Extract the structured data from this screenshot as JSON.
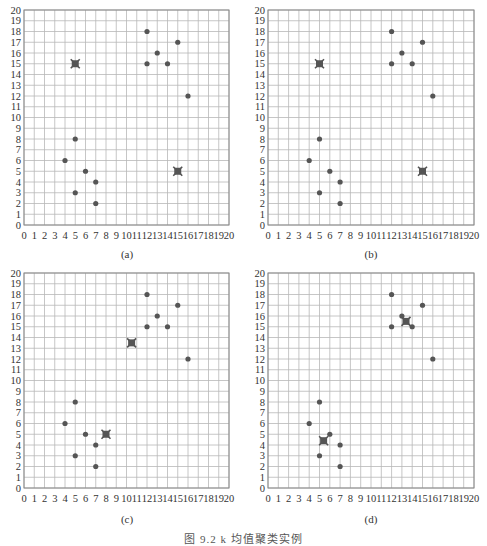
{
  "figure": {
    "caption": "图 9.2  k 均值聚类实例",
    "colors": {
      "grid": "#b8b8b8",
      "frame": "#888888",
      "point": "#555555",
      "centroid": "#555555",
      "text": "#333333"
    }
  },
  "chart_data": [
    {
      "type": "scatter",
      "panel_label": "(a)",
      "title": "",
      "xlabel": "",
      "ylabel": "",
      "xlim": [
        0,
        20
      ],
      "ylim": [
        0,
        20
      ],
      "x_ticks": [
        "0",
        "1",
        "2",
        "3",
        "4",
        "5",
        "6",
        "7",
        "8",
        "9",
        "10",
        "11",
        "12",
        "13",
        "14",
        "15",
        "16",
        "17",
        "18",
        "19",
        "20"
      ],
      "y_ticks": [
        "0",
        "1",
        "2",
        "3",
        "4",
        "5",
        "6",
        "7",
        "8",
        "9",
        "10",
        "11",
        "12",
        "13",
        "14",
        "15",
        "16",
        "17",
        "18",
        "19",
        "20"
      ],
      "grid": true,
      "series": [
        {
          "name": "points",
          "marker": "circle",
          "x": [
            4,
            5,
            5,
            6,
            7,
            7,
            12,
            12,
            13,
            14,
            15,
            16
          ],
          "y": [
            6,
            8,
            3,
            5,
            4,
            2,
            18,
            15,
            16,
            15,
            17,
            12
          ]
        },
        {
          "name": "centroids",
          "marker": "x-square",
          "x": [
            5,
            15
          ],
          "y": [
            15,
            5
          ]
        }
      ]
    },
    {
      "type": "scatter",
      "panel_label": "(b)",
      "title": "",
      "xlabel": "",
      "ylabel": "",
      "xlim": [
        0,
        20
      ],
      "ylim": [
        0,
        20
      ],
      "x_ticks": [
        "0",
        "1",
        "2",
        "3",
        "4",
        "5",
        "6",
        "7",
        "8",
        "9",
        "10",
        "11",
        "12",
        "13",
        "14",
        "15",
        "16",
        "17",
        "18",
        "19",
        "20"
      ],
      "y_ticks": [
        "0",
        "1",
        "2",
        "3",
        "4",
        "5",
        "6",
        "7",
        "8",
        "9",
        "10",
        "11",
        "12",
        "13",
        "14",
        "15",
        "16",
        "17",
        "18",
        "19",
        "20"
      ],
      "grid": true,
      "series": [
        {
          "name": "cluster-1 points",
          "marker": "circle",
          "x": [
            12,
            12,
            13,
            14,
            15,
            16
          ],
          "y": [
            18,
            15,
            16,
            15,
            17,
            12
          ]
        },
        {
          "name": "cluster-2 points",
          "marker": "circle",
          "x": [
            4,
            5,
            5,
            6,
            7,
            7
          ],
          "y": [
            6,
            8,
            3,
            5,
            4,
            2
          ]
        },
        {
          "name": "centroids",
          "marker": "x-square",
          "x": [
            5,
            15
          ],
          "y": [
            15,
            5
          ]
        }
      ]
    },
    {
      "type": "scatter",
      "panel_label": "(c)",
      "title": "",
      "xlabel": "",
      "ylabel": "",
      "xlim": [
        0,
        20
      ],
      "ylim": [
        0,
        20
      ],
      "x_ticks": [
        "0",
        "1",
        "2",
        "3",
        "4",
        "5",
        "6",
        "7",
        "8",
        "9",
        "10",
        "11",
        "12",
        "13",
        "14",
        "15",
        "16",
        "17",
        "18",
        "19",
        "20"
      ],
      "y_ticks": [
        "0",
        "1",
        "2",
        "3",
        "4",
        "5",
        "6",
        "7",
        "8",
        "9",
        "10",
        "11",
        "12",
        "13",
        "14",
        "15",
        "16",
        "17",
        "18",
        "19",
        "20"
      ],
      "grid": true,
      "series": [
        {
          "name": "points",
          "marker": "circle",
          "x": [
            4,
            5,
            5,
            6,
            7,
            7,
            12,
            12,
            13,
            14,
            15,
            16
          ],
          "y": [
            6,
            8,
            3,
            5,
            4,
            2,
            18,
            15,
            16,
            15,
            17,
            12
          ]
        },
        {
          "name": "centroids",
          "marker": "x-square",
          "x": [
            10.5,
            8
          ],
          "y": [
            13.5,
            5
          ]
        }
      ]
    },
    {
      "type": "scatter",
      "panel_label": "(d)",
      "title": "",
      "xlabel": "",
      "ylabel": "",
      "xlim": [
        0,
        20
      ],
      "ylim": [
        0,
        20
      ],
      "x_ticks": [
        "0",
        "1",
        "2",
        "3",
        "4",
        "5",
        "6",
        "7",
        "8",
        "9",
        "10",
        "11",
        "12",
        "13",
        "14",
        "15",
        "16",
        "17",
        "18",
        "19",
        "20"
      ],
      "y_ticks": [
        "0",
        "1",
        "2",
        "3",
        "4",
        "5",
        "6",
        "7",
        "8",
        "9",
        "10",
        "11",
        "12",
        "13",
        "14",
        "15",
        "16",
        "17",
        "18",
        "19",
        "20"
      ],
      "grid": true,
      "series": [
        {
          "name": "points",
          "marker": "circle",
          "x": [
            4,
            5,
            5,
            6,
            7,
            7,
            12,
            12,
            13,
            14,
            15,
            16
          ],
          "y": [
            6,
            8,
            3,
            5,
            4,
            2,
            18,
            15,
            16,
            15,
            17,
            12
          ]
        },
        {
          "name": "centroids",
          "marker": "x-square",
          "x": [
            13.4,
            5.4
          ],
          "y": [
            15.5,
            4.4
          ]
        }
      ]
    }
  ]
}
